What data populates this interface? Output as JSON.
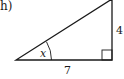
{
  "figure": {
    "part_label": "h)",
    "shape": "right-triangle",
    "labels": {
      "angle": "x",
      "vertical_side": "4",
      "horizontal_side": "7"
    },
    "colors": {
      "stroke": "#1a1a1a",
      "background": "#ffffff"
    }
  }
}
